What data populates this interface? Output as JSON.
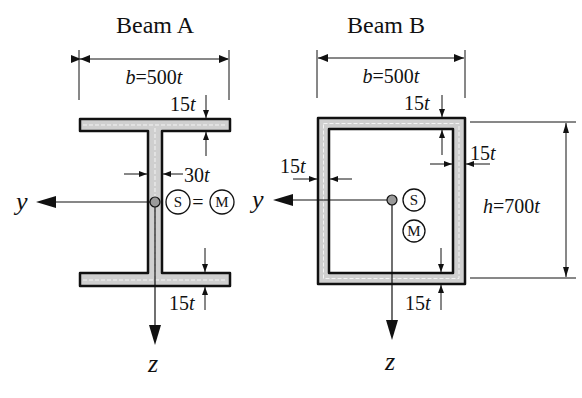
{
  "figure": {
    "beam_a": {
      "title": "Beam A",
      "width_label_var": "b",
      "width_label_val": "=500",
      "width_label_unit": "t",
      "top_flange_thickness_num": "15",
      "top_flange_thickness_unit": "t",
      "web_thickness_num": "30",
      "web_thickness_unit": "t",
      "bottom_flange_thickness_num": "15",
      "bottom_flange_thickness_unit": "t",
      "shear_center": "S",
      "equals": "=",
      "centroid": "M",
      "axis_y": "y",
      "axis_z": "z"
    },
    "beam_b": {
      "title": "Beam B",
      "width_label_var": "b",
      "width_label_val": "=500",
      "width_label_unit": "t",
      "top_thickness_num": "15",
      "top_thickness_unit": "t",
      "left_thickness_num": "15",
      "left_thickness_unit": "t",
      "right_thickness_num": "15",
      "right_thickness_unit": "t",
      "bottom_thickness_num": "15",
      "bottom_thickness_unit": "t",
      "height_label_var": "h",
      "height_label_val": "=700",
      "height_label_unit": "t",
      "shear_center": "S",
      "centroid": "M",
      "axis_y": "y",
      "axis_z": "z"
    },
    "colors": {
      "line": "#111111",
      "fill": "#c8c8c8",
      "centroid_dot": "#9a9a9a"
    }
  }
}
